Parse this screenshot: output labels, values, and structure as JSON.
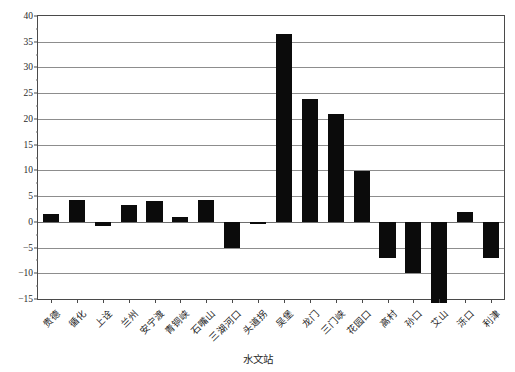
{
  "chart_data": {
    "type": "bar",
    "title": "",
    "xlabel": "水文站",
    "ylabel": "输沙量比例/%",
    "categories": [
      "贵德",
      "循化",
      "上诠",
      "兰州",
      "安宁渡",
      "青铜峡",
      "石嘴山",
      "三湖河口",
      "头道拐",
      "吴堡",
      "龙门",
      "三门峡",
      "花园口",
      "高村",
      "孙口",
      "艾山",
      "泺口",
      "利津"
    ],
    "values": [
      1.6,
      4.2,
      -0.8,
      3.2,
      4.0,
      1.0,
      4.2,
      -5.0,
      -0.5,
      36.5,
      23.8,
      21.0,
      9.8,
      -7.0,
      -10.0,
      -15.7,
      2.0,
      -7.0
    ],
    "ylim": [
      -15,
      40
    ],
    "yticks": [
      -15,
      -10,
      -5,
      0,
      5,
      10,
      15,
      20,
      25,
      30,
      35,
      40
    ],
    "ytick_labels": [
      "−15",
      "−10",
      "−5",
      "0",
      "5",
      "10",
      "15",
      "20",
      "25",
      "30",
      "35",
      "40"
    ],
    "grid": true,
    "legend": "none",
    "bar_color": "#0b0b0b",
    "series_name": "输沙量比例"
  },
  "axes": {
    "y_axis_title": "输沙量比例/%",
    "x_axis_title": "水文站"
  }
}
